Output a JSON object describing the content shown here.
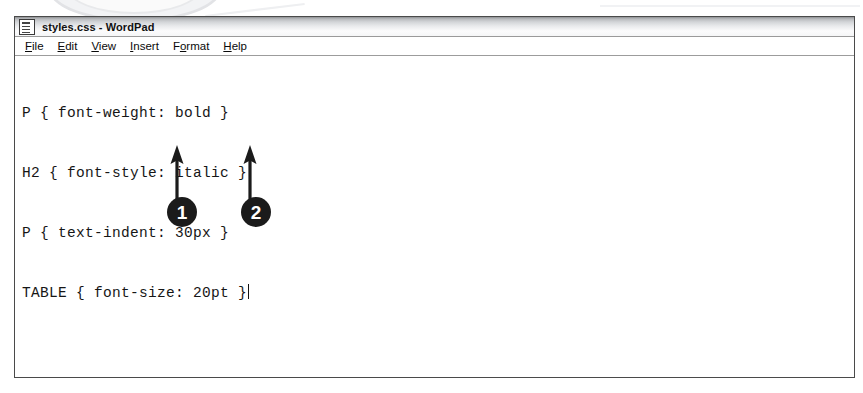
{
  "window": {
    "title": "styles.css - WordPad",
    "icon": "document-icon",
    "menu": [
      {
        "name": "file",
        "pre": "",
        "key": "F",
        "post": "ile"
      },
      {
        "name": "edit",
        "pre": "",
        "key": "E",
        "post": "dit"
      },
      {
        "name": "view",
        "pre": "",
        "key": "V",
        "post": "iew"
      },
      {
        "name": "insert",
        "pre": "",
        "key": "I",
        "post": "nsert"
      },
      {
        "name": "format",
        "pre": "F",
        "key": "o",
        "post": "rmat"
      },
      {
        "name": "help",
        "pre": "",
        "key": "H",
        "post": "elp"
      }
    ]
  },
  "document": {
    "filename": "styles.css",
    "lines": [
      "P { font-weight: bold }",
      "H2 { font-style: italic }",
      "P { text-indent: 30px }",
      "TABLE { font-size: 20pt }"
    ]
  },
  "callouts": [
    {
      "number": "1",
      "target": "font-size-property-name"
    },
    {
      "number": "2",
      "target": "font-size-property-value"
    }
  ],
  "colors": {
    "callout_fill": "#1b1b1b",
    "callout_text": "#ffffff",
    "window_border": "#4a4a4a",
    "text": "#161616"
  }
}
